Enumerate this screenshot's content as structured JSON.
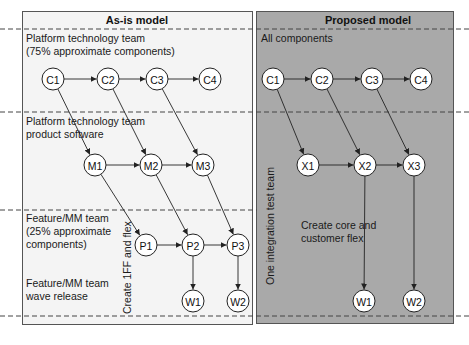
{
  "colors": {
    "left_panel_bg": "#f4f4f4",
    "right_panel_bg": "#a9a9a9",
    "node_fill": "#ffffff",
    "stroke": "#222222"
  },
  "left_panel": {
    "title": "As-is model",
    "lanes": [
      {
        "label_lines": [
          "Platform technology team",
          "(75% approximate components)"
        ]
      },
      {
        "label_lines": [
          "Platform technology team",
          "product software"
        ]
      },
      {
        "label_lines": [
          "Feature/MM team",
          "(25% approximate",
          "components)"
        ]
      },
      {
        "label_lines": [
          "Feature/MM team",
          "wave release"
        ]
      }
    ],
    "vertical_label": "Create 1FF and flex",
    "nodes": [
      {
        "id": "C1",
        "x": 53,
        "y": 79
      },
      {
        "id": "C2",
        "x": 108,
        "y": 79
      },
      {
        "id": "C3",
        "x": 157,
        "y": 79
      },
      {
        "id": "C4",
        "x": 210,
        "y": 79
      },
      {
        "id": "M1",
        "x": 95,
        "y": 165
      },
      {
        "id": "M2",
        "x": 151,
        "y": 165
      },
      {
        "id": "M3",
        "x": 203,
        "y": 165
      },
      {
        "id": "P1",
        "x": 146,
        "y": 245
      },
      {
        "id": "P2",
        "x": 193,
        "y": 245
      },
      {
        "id": "P3",
        "x": 238,
        "y": 245
      },
      {
        "id": "W1",
        "x": 193,
        "y": 301
      },
      {
        "id": "W2",
        "x": 238,
        "y": 301
      }
    ],
    "edges": [
      [
        "C1",
        "C2"
      ],
      [
        "C2",
        "C3"
      ],
      [
        "C3",
        "C4"
      ],
      [
        "C1",
        "M1"
      ],
      [
        "C2",
        "M2"
      ],
      [
        "C3",
        "M3"
      ],
      [
        "M1",
        "M2"
      ],
      [
        "M2",
        "M3"
      ],
      [
        "M1",
        "P1"
      ],
      [
        "M2",
        "P2"
      ],
      [
        "M3",
        "P3"
      ],
      [
        "P1",
        "P2"
      ],
      [
        "P2",
        "P3"
      ],
      [
        "P2",
        "W1"
      ],
      [
        "P3",
        "W2"
      ]
    ]
  },
  "right_panel": {
    "title": "Proposed model",
    "lanes": [
      {
        "label_lines": [
          "All components"
        ]
      }
    ],
    "vertical_label": "One integration test team",
    "annotation_lines": [
      "Create core and",
      "customer flex"
    ],
    "nodes": [
      {
        "id": "C1",
        "x": 273,
        "y": 79
      },
      {
        "id": "C2",
        "x": 322,
        "y": 79
      },
      {
        "id": "C3",
        "x": 372,
        "y": 79
      },
      {
        "id": "C4",
        "x": 421,
        "y": 79
      },
      {
        "id": "X1",
        "x": 308,
        "y": 165
      },
      {
        "id": "X2",
        "x": 365,
        "y": 165
      },
      {
        "id": "X3",
        "x": 414,
        "y": 165
      },
      {
        "id": "W1",
        "x": 364,
        "y": 301
      },
      {
        "id": "W2",
        "x": 414,
        "y": 301
      }
    ],
    "edges": [
      [
        "C1",
        "C2"
      ],
      [
        "C2",
        "C3"
      ],
      [
        "C3",
        "C4"
      ],
      [
        "C1",
        "X1"
      ],
      [
        "C2",
        "X2"
      ],
      [
        "C3",
        "X3"
      ],
      [
        "X1",
        "X2"
      ],
      [
        "X2",
        "X3"
      ],
      [
        "X2",
        "W1"
      ],
      [
        "X3",
        "W2"
      ]
    ]
  }
}
